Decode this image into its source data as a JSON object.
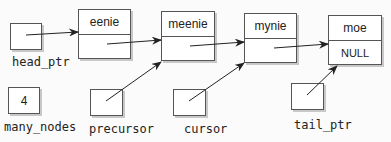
{
  "nodes": [
    {
      "data": "eenie",
      "link": ""
    },
    {
      "data": "meenie",
      "link": ""
    },
    {
      "data": "mynie",
      "link": ""
    },
    {
      "data": "moe",
      "link": "NULL"
    }
  ],
  "variables": {
    "head_ptr": {
      "label": "head_ptr",
      "value": ""
    },
    "many_nodes": {
      "label": "many_nodes",
      "value": "4"
    },
    "precursor": {
      "label": "precursor",
      "value": ""
    },
    "cursor": {
      "label": "cursor",
      "value": ""
    },
    "tail_ptr": {
      "label": "tail_ptr",
      "value": ""
    }
  },
  "colors": {
    "line": "#222222",
    "border": "#555555",
    "shadow": "#c8c8c8"
  }
}
